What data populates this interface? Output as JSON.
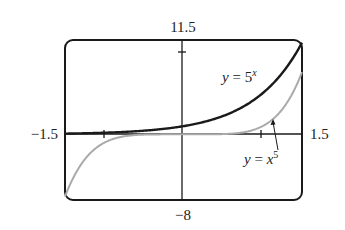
{
  "chart_data": {
    "type": "line",
    "title": "",
    "xlabel": "",
    "ylabel": "",
    "xlim": [
      -1.5,
      1.5
    ],
    "ylim": [
      -8,
      11.5
    ],
    "grid": false,
    "x_ticks": [
      -1,
      1
    ],
    "y_ticks": [
      10
    ],
    "window_labels": {
      "xmin": "−1.5",
      "xmax": "1.5",
      "ymin": "−8",
      "ymax": "11.5"
    },
    "series": [
      {
        "name": "y = 5^x",
        "function": "5^x",
        "color": "#1a1a1a",
        "x": [
          -1.5,
          -1,
          -0.5,
          0,
          0.5,
          1,
          1.5
        ],
        "y": [
          0.09,
          0.2,
          0.45,
          1,
          2.24,
          5,
          11.18
        ]
      },
      {
        "name": "y = x^5",
        "function": "x^5",
        "color": "#aaaaaa",
        "x": [
          -1.5,
          -1,
          -0.5,
          0,
          0.5,
          1,
          1.5
        ],
        "y": [
          -7.59,
          -1,
          -0.03,
          0,
          0.03,
          1,
          7.59
        ]
      }
    ],
    "annotations": [
      {
        "text": "y = 5^x",
        "position": "upper right, left of curve"
      },
      {
        "text": "y = x^5",
        "position": "lower right, with arrow to curve near x=1.15"
      }
    ]
  },
  "labels": {
    "ymax": "11.5",
    "ymin": "−8",
    "xmin": "−1.5",
    "xmax": "1.5",
    "exp_y": "y",
    "exp_eq": " = 5",
    "exp_sup": "x",
    "pow_y": "y",
    "pow_eq": " = ",
    "pow_x": "x",
    "pow_sup": "5"
  }
}
